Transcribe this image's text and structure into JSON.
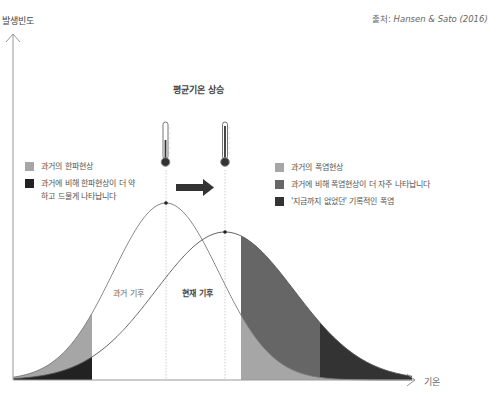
{
  "axes": {
    "y_label": "발생빈도",
    "x_label": "기온"
  },
  "source": {
    "prefix": "출처: ",
    "citation": "Hansen & Sato (2016)"
  },
  "title": "평균기온 상승",
  "legend_left": [
    {
      "label": "과거의 한파현상",
      "color": "#a6a6a6"
    },
    {
      "label": "과거에 비해 한파현상이 더 약하고 드물게 나타납니다",
      "color": "#222222"
    }
  ],
  "legend_right": [
    {
      "label": "과거의 폭염현상",
      "color": "#a6a6a6"
    },
    {
      "label": "과거에 비해 폭염현상이 더 자주 나타납니다",
      "color": "#666666"
    },
    {
      "label": "'지금까지 없었던' 기록적인 폭염",
      "color": "#333333"
    }
  ],
  "curves": {
    "past_label": "과거 기후",
    "present_label": "현재 기후"
  },
  "colors": {
    "axis": "#999999",
    "curve": "#777777",
    "light_shade": "#a6a6a6",
    "mid_shade": "#666666",
    "dark_shade": "#333333",
    "cold_dark": "#222222"
  },
  "icons": [
    "thermometer-icon",
    "thermometer-icon",
    "right-arrow-icon"
  ]
}
